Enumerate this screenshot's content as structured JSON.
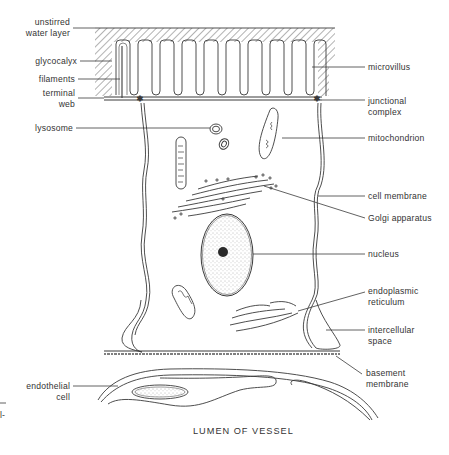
{
  "figure": {
    "caption": "LUMEN OF VESSEL",
    "left_labels": [
      {
        "id": "unstirred-water-layer",
        "text": "unstirred\nwater layer"
      },
      {
        "id": "glycocalyx",
        "text": "glycocalyx"
      },
      {
        "id": "filaments",
        "text": "filaments"
      },
      {
        "id": "terminal-web",
        "text": "terminal\nweb"
      },
      {
        "id": "lysosome",
        "text": "lysosome"
      },
      {
        "id": "endothelial-cell",
        "text": "endothelial\ncell"
      }
    ],
    "right_labels": [
      {
        "id": "microvillus",
        "text": "microvillus"
      },
      {
        "id": "junctional-complex",
        "text": "junctional\ncomplex"
      },
      {
        "id": "mitochondrion",
        "text": "mitochondrion"
      },
      {
        "id": "cell-membrane",
        "text": "cell membrane"
      },
      {
        "id": "golgi-apparatus",
        "text": "Golgi apparatus"
      },
      {
        "id": "nucleus",
        "text": "nucleus"
      },
      {
        "id": "endoplasmic-reticulum",
        "text": "endoplasmic\nreticulum"
      },
      {
        "id": "intercellular-space",
        "text": "intercellular\nspace"
      },
      {
        "id": "basement-membrane",
        "text": "basement\nmembrane"
      }
    ],
    "edge_fragment": "l-",
    "colors": {
      "ink": "#3a3a3a",
      "text": "#333333",
      "background": "#ffffff"
    }
  }
}
